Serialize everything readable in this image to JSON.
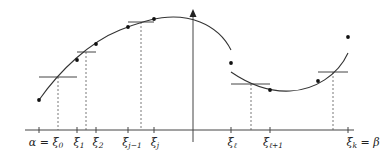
{
  "figure": {
    "colors": {
      "curve": "#333333",
      "axis": "#444444",
      "dashed": "#555555",
      "points": "#111111"
    },
    "x_axis": {
      "y": 130,
      "x_start": 25,
      "x_end": 354,
      "ticks": [
        {
          "id": "xi0",
          "x": 39,
          "label": "α = ξ",
          "sub": "0"
        },
        {
          "id": "xi1",
          "x": 77,
          "label": "ξ",
          "sub": "1"
        },
        {
          "id": "xi2",
          "x": 96,
          "label": "ξ",
          "sub": "2"
        },
        {
          "id": "xijm1",
          "x": 128,
          "label": "ξ",
          "sub": "j−1"
        },
        {
          "id": "xij",
          "x": 154,
          "label": "ξ",
          "sub": "j"
        },
        {
          "id": "xil",
          "x": 231,
          "label": "ξ",
          "sub": "ℓ"
        },
        {
          "id": "xil1",
          "x": 270,
          "label": "ξ",
          "sub": "ℓ+1"
        },
        {
          "id": "xik",
          "x": 348,
          "label": "ξ",
          "sub": "k",
          "suffix": " = β"
        }
      ]
    },
    "y_axis": {
      "x": 193,
      "y_top": 10,
      "y_bottom": 142
    },
    "dashed_lines": [
      {
        "x": 58,
        "y_top": 77
      },
      {
        "x": 86,
        "y_top": 52
      },
      {
        "x": 141,
        "y_top": 22
      },
      {
        "x": 251,
        "y_top": 84
      },
      {
        "x": 333,
        "y_top": 72
      }
    ],
    "step_segments": [
      {
        "x1": 39,
        "x2": 77,
        "y": 77
      },
      {
        "x1": 77,
        "x2": 96,
        "y": 52
      },
      {
        "x1": 128,
        "x2": 154,
        "y": 22
      },
      {
        "x1": 231,
        "x2": 270,
        "y": 84
      },
      {
        "x1": 318,
        "x2": 348,
        "y": 72
      }
    ],
    "dots": [
      {
        "x": 39,
        "y": 100
      },
      {
        "x": 77,
        "y": 60
      },
      {
        "x": 96,
        "y": 44
      },
      {
        "x": 128,
        "y": 27
      },
      {
        "x": 154,
        "y": 19
      },
      {
        "x": 231,
        "y": 63
      },
      {
        "x": 270,
        "y": 90
      },
      {
        "x": 318,
        "y": 81
      },
      {
        "x": 348,
        "y": 37
      }
    ],
    "curves": {
      "left": "M39,100 C60,70 90,42 120,30 C150,18 175,12 200,22 C215,28 225,38 231,50",
      "right": "M231,72 C250,85 270,92 290,91 C315,90 338,75 348,53"
    }
  },
  "labels": {
    "xi0": {
      "main": "α = ξ",
      "sub": "0"
    },
    "xi1": {
      "main": "ξ",
      "sub": "1"
    },
    "xi2": {
      "main": "ξ",
      "sub": "2"
    },
    "xijm1": {
      "main": "ξ",
      "sub": "j−1"
    },
    "xij": {
      "main": "ξ",
      "sub": "j"
    },
    "xil": {
      "main": "ξ",
      "sub": "ℓ"
    },
    "xil1": {
      "main": "ξ",
      "sub": "ℓ+1"
    },
    "xik": {
      "main": "ξ",
      "sub": "k",
      "suffix": " = β"
    }
  }
}
